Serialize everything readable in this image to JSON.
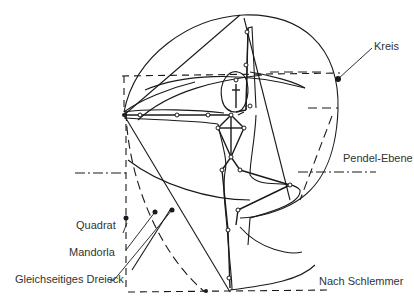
{
  "diagram": {
    "labels": {
      "kreis": "Kreis",
      "pendel_ebene": "Pendel-Ebene",
      "quadrat": "Quadrat",
      "mandorla": "Mandorla",
      "dreieck": "Gleichseitiges Dreieck",
      "credit": "Nach Schlemmer"
    },
    "colors": {
      "line": "#1a1a1a",
      "text": "#333333",
      "background": "#ffffff"
    }
  }
}
